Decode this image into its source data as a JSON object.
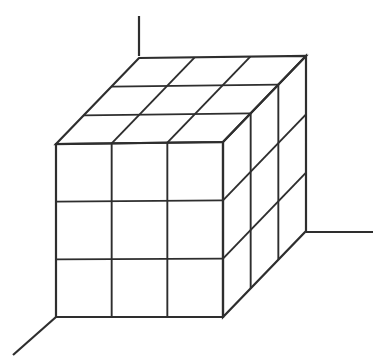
{
  "figure": {
    "canvas": {
      "width": 391,
      "height": 360,
      "background": "#ffffff"
    },
    "style": {
      "stroke_color": "#2e2e2e",
      "edge_stroke_width": 2.2,
      "grid_stroke_width": 1.9,
      "axis_stroke_width": 2.2
    },
    "divisions": {
      "x": 3,
      "y": 3,
      "z": 3
    },
    "geometry": {
      "front_top_left": [
        56,
        144
      ],
      "front_top_right": [
        223,
        142
      ],
      "front_bottom_right": [
        223,
        317
      ],
      "front_bottom_left": [
        56,
        317
      ],
      "depth_offset": [
        83,
        -86
      ],
      "back_top_left": [
        139,
        56
      ],
      "back_top_right": [
        306,
        57
      ],
      "back_bottom_right": [
        306,
        232
      ],
      "back_bottom_left": [
        139,
        231
      ]
    },
    "axes": [
      {
        "name": "vertical-axis",
        "from": [
          139,
          56
        ],
        "to": [
          139,
          16
        ],
        "label": ""
      },
      {
        "name": "horizontal-axis",
        "from": [
          306,
          232
        ],
        "to": [
          373,
          232
        ],
        "label": ""
      },
      {
        "name": "diagonal-axis",
        "from": [
          56,
          317
        ],
        "to": [
          13,
          355
        ],
        "label": ""
      }
    ],
    "faces": [
      {
        "name": "front-face",
        "visible": true,
        "cells": 9
      },
      {
        "name": "top-face",
        "visible": true,
        "cells": 9
      },
      {
        "name": "right-face",
        "visible": true,
        "cells": 9
      }
    ]
  }
}
